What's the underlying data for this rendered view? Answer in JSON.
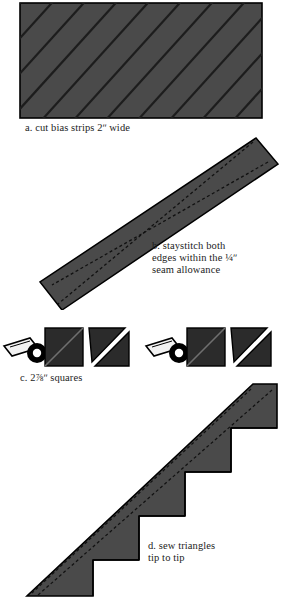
{
  "document": {
    "title": "Making bias-strip triangle units",
    "background_color": "#ffffff",
    "fabric_color": "#4a4a4a",
    "fabric_dark_color": "#2b2b2b",
    "outline_color": "#000000",
    "stitch_color": "#111111",
    "text_color": "#1c1c1c"
  },
  "steps": [
    {
      "id": "a",
      "label": "a",
      "caption": "a. cut bias strips 2ʺ wide",
      "measurement": "2ʺ",
      "figure": "hatched-fabric-rectangle",
      "description": "Rectangle of fabric marked with parallel diagonal cutting lines on the bias"
    },
    {
      "id": "b",
      "label": "b",
      "caption": "b. staystitch both\nedges within the ¼ʺ\nseam allowance",
      "measurement": "¼ʺ",
      "figure": "bias-strip-parallelogram",
      "description": "Single diagonal bias strip with dashed staystitching along both long edges"
    },
    {
      "id": "c",
      "label": "c",
      "caption": "c.  2⅞ʺ squares",
      "measurement": "2⅞ʺ",
      "figure": "squares-with-rotary-cutter",
      "description": "Squares marked corner to corner and cut diagonally with a rotary cutter",
      "pairs": 2,
      "squares_per_pair": 2
    },
    {
      "id": "d",
      "label": "d",
      "caption": "d. sew triangles\ntip to tip",
      "figure": "triangle-staircase",
      "description": "Chain of triangles joined tip to tip forming a stair-step band with dashed seams",
      "steps_in_stair": 4
    }
  ]
}
